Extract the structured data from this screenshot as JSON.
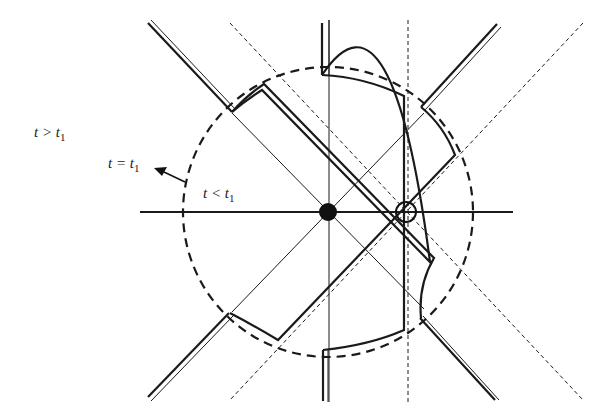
{
  "diagram": {
    "labels": {
      "outside": {
        "var": "t",
        "op": ">",
        "sub_var": "t",
        "sub": "1"
      },
      "boundary": {
        "var": "t",
        "op": "=",
        "sub_var": "t",
        "sub": "1"
      },
      "inside": {
        "var": "t",
        "op": "<",
        "sub_var": "t",
        "sub": "1"
      }
    },
    "elements": {
      "center_dot": "filled-circle",
      "offset_marker": "open-circle",
      "boundary_circle": "dashed-circle",
      "arrow": "boundary-arrow"
    },
    "colors": {
      "stroke": "#1a1a1a",
      "background": "#ffffff"
    }
  }
}
